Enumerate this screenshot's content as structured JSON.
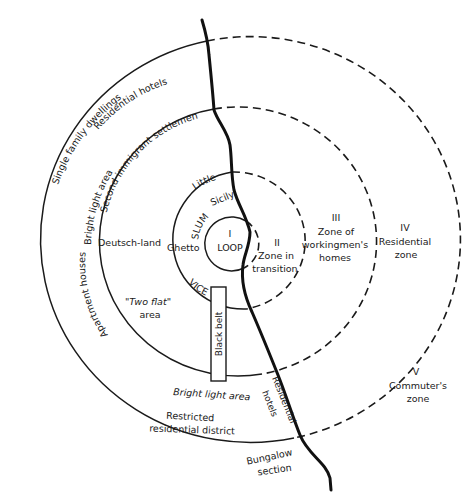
{
  "colors": {
    "ink": "#1a1a1a",
    "background": "#ffffff"
  },
  "zones": [
    {
      "numeral": "I",
      "name": "LOOP"
    },
    {
      "numeral": "II",
      "name_line1": "Zone in",
      "name_line2": "transition"
    },
    {
      "numeral": "III",
      "name_line1": "Zone of",
      "name_line2": "workingmen's",
      "name_line3": "homes"
    },
    {
      "numeral": "IV",
      "name_line1": "Residential",
      "name_line2": "zone"
    },
    {
      "numeral": "V",
      "name_line1": "Commuter's",
      "name_line2": "zone"
    }
  ],
  "zone2_areas": {
    "little_sicily_line1": "Little",
    "little_sicily_line2": "Sicily",
    "slum": "SLUM",
    "ghetto": "Ghetto",
    "vice": "VICE",
    "black_belt": "Black belt"
  },
  "zone3_areas": {
    "deutschland": "Deutsch-land",
    "two_flat_line1": "\"Two flat\"",
    "two_flat_line2": "area",
    "second_immigrant": "Second immigrant settlement"
  },
  "zone4_areas": {
    "bright_light_upper": "Bright  light  area",
    "apartment_houses": "Apartment   houses",
    "residential_hotels_upper": "Residential hotels",
    "single_family": "Single family dwellings",
    "bright_light_lower": "Bright light area",
    "restricted_line1": "Restricted",
    "restricted_line2": "residential district",
    "residential_hotels_river_line1": "Residential",
    "residential_hotels_river_line2": "hotels"
  },
  "zone5_areas": {
    "bungalow_line1": "Bungalow",
    "bungalow_line2": "section"
  }
}
